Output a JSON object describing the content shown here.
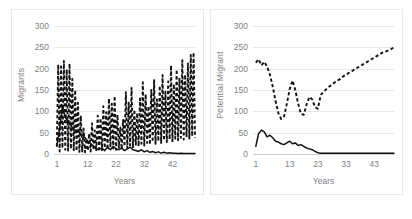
{
  "chart_data": [
    {
      "type": "line",
      "title": "",
      "xlabel": "Years",
      "ylabel": "Migrants",
      "ylim": [
        0,
        300
      ],
      "xlim": [
        0,
        50
      ],
      "yticks": [
        300,
        250,
        200,
        150,
        100,
        50,
        0
      ],
      "xticks": [
        1,
        12,
        22,
        32,
        42
      ],
      "grid": true,
      "legend": "none",
      "series": [
        {
          "name": "dashed-oscillating",
          "style": "dashed",
          "x": [
            1,
            1.5,
            2,
            2.5,
            3,
            3.5,
            4,
            4.5,
            5,
            5.5,
            6,
            6.5,
            7,
            7.5,
            8,
            8.5,
            9,
            9.5,
            10,
            10.5,
            11,
            11.5,
            12,
            12.5,
            13,
            13.5,
            14,
            14.5,
            15,
            15.5,
            16,
            16.5,
            17,
            17.5,
            18,
            18.5,
            19,
            19.5,
            20,
            20.5,
            21,
            21.5,
            22,
            22.5,
            23,
            23.5,
            24,
            24.5,
            25,
            25.5,
            26,
            26.5,
            27,
            27.5,
            28,
            28.5,
            29,
            29.5,
            30,
            30.5,
            31,
            31.5,
            32,
            32.5,
            33,
            33.5,
            34,
            34.5,
            35,
            35.5,
            36,
            36.5,
            37,
            37.5,
            38,
            38.5,
            39,
            39.5,
            40,
            40.5,
            41,
            41.5,
            42,
            42.5,
            43,
            43.5,
            44,
            44.5,
            45,
            45.5,
            46,
            46.5,
            47,
            47.5,
            48,
            48.5,
            49,
            49.5,
            50
          ],
          "values": [
            18,
            210,
            6,
            205,
            14,
            218,
            10,
            198,
            8,
            212,
            12,
            176,
            9,
            150,
            7,
            120,
            5,
            90,
            6,
            60,
            4,
            35,
            8,
            48,
            6,
            72,
            10,
            55,
            7,
            90,
            12,
            84,
            9,
            112,
            14,
            98,
            11,
            130,
            16,
            118,
            13,
            136,
            10,
            92,
            15,
            62,
            12,
            80,
            18,
            145,
            14,
            120,
            20,
            155,
            16,
            104,
            22,
            96,
            18,
            130,
            24,
            168,
            20,
            140,
            26,
            112,
            22,
            150,
            28,
            175,
            24,
            128,
            30,
            160,
            26,
            185,
            32,
            146,
            28,
            170,
            34,
            208,
            30,
            164,
            36,
            198,
            32,
            178,
            38,
            220,
            34,
            186,
            40,
            212,
            36,
            232,
            42,
            238,
            38,
            240,
            44,
            248
          ]
        },
        {
          "name": "solid-decaying",
          "style": "solid",
          "x": [
            1,
            2,
            3,
            4,
            5,
            6,
            7,
            8,
            9,
            10,
            11,
            12,
            13,
            14,
            15,
            16,
            17,
            18,
            19,
            20,
            21,
            22,
            23,
            24,
            25,
            26,
            27,
            28,
            29,
            30,
            31,
            32,
            33,
            34,
            35,
            36,
            37,
            38,
            39,
            40,
            41,
            42,
            43,
            44,
            45,
            46,
            47,
            48,
            49,
            50
          ],
          "values": [
            18,
            60,
            112,
            86,
            74,
            66,
            58,
            54,
            50,
            44,
            38,
            30,
            24,
            18,
            12,
            10,
            14,
            8,
            16,
            10,
            18,
            12,
            10,
            14,
            8,
            12,
            16,
            10,
            8,
            6,
            10,
            5,
            8,
            4,
            6,
            3,
            5,
            2,
            4,
            2,
            3,
            2,
            2,
            1,
            2,
            1,
            1,
            1,
            1,
            1
          ]
        }
      ]
    },
    {
      "type": "line",
      "title": "",
      "xlabel": "Years",
      "ylabel": "Potential Migrant",
      "ylim": [
        0,
        300
      ],
      "xlim": [
        0,
        50
      ],
      "yticks": [
        300,
        250,
        200,
        150,
        100,
        50,
        0
      ],
      "xticks": [
        1,
        13,
        23,
        33,
        43
      ],
      "grid": true,
      "legend": "none",
      "series": [
        {
          "name": "dashed-potential",
          "style": "dashed",
          "x": [
            1,
            2,
            3,
            4,
            5,
            6,
            7,
            8,
            9,
            10,
            11,
            12,
            13,
            14,
            15,
            16,
            17,
            18,
            19,
            20,
            21,
            22,
            23,
            24,
            25,
            26,
            27,
            28,
            29,
            30,
            31,
            32,
            33,
            34,
            35,
            36,
            37,
            38,
            39,
            40,
            41,
            42,
            43,
            44,
            45,
            46,
            47,
            48,
            49,
            50
          ],
          "values": [
            214,
            222,
            208,
            216,
            205,
            186,
            158,
            124,
            96,
            82,
            88,
            118,
            152,
            172,
            150,
            118,
            94,
            92,
            116,
            134,
            128,
            110,
            106,
            138,
            146,
            152,
            158,
            162,
            168,
            172,
            176,
            182,
            186,
            190,
            194,
            198,
            202,
            206,
            210,
            214,
            218,
            222,
            226,
            230,
            234,
            238,
            240,
            243,
            246,
            250
          ]
        },
        {
          "name": "solid-potential",
          "style": "solid",
          "x": [
            1,
            2,
            3,
            4,
            5,
            6,
            7,
            8,
            9,
            10,
            11,
            12,
            13,
            14,
            15,
            16,
            17,
            18,
            19,
            20,
            21,
            22,
            23,
            24,
            25,
            26,
            27,
            28,
            29,
            30,
            31,
            32,
            33,
            34,
            35,
            36,
            37,
            38,
            39,
            40,
            41,
            42,
            43,
            44,
            45,
            46,
            47,
            48,
            49,
            50
          ],
          "values": [
            18,
            48,
            56,
            52,
            40,
            44,
            38,
            30,
            28,
            24,
            22,
            26,
            30,
            24,
            26,
            20,
            22,
            18,
            14,
            12,
            10,
            6,
            3,
            2,
            2,
            2,
            2,
            2,
            2,
            2,
            2,
            2,
            2,
            2,
            2,
            2,
            2,
            2,
            2,
            2,
            2,
            2,
            2,
            2,
            2,
            2,
            2,
            2,
            2,
            2
          ]
        }
      ]
    }
  ]
}
